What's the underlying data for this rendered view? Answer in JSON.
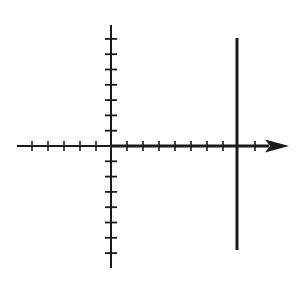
{
  "diagram": {
    "colors": {
      "stroke": "#1a1a1a",
      "background": "#ffffff"
    },
    "origin": {
      "x": 111,
      "y": 146
    },
    "x_axis": {
      "start_x": 17,
      "end_x": 289,
      "y": 146,
      "arrow": "right",
      "tick_spacing": 16,
      "ticks_left_of_origin": 5,
      "ticks_right_of_origin": 9
    },
    "y_axis": {
      "x": 111,
      "top_y": 25,
      "bottom_y": 268,
      "tick_spacing": 15.3,
      "ticks_above_origin": 7,
      "ticks_below_origin": 7
    },
    "vertical_line": {
      "x": 237,
      "top_y": 38,
      "bottom_y": 250,
      "thickness": 3
    }
  }
}
